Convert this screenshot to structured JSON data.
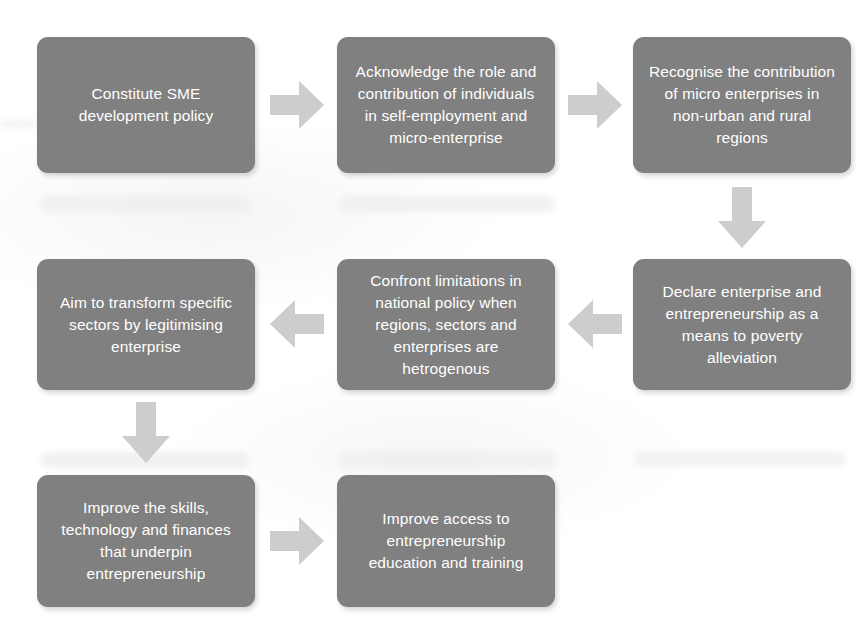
{
  "diagram": {
    "colors": {
      "node_fill": "#808080",
      "node_text": "#ffffff",
      "arrow_fill": "#cdcdcd",
      "background": "#ffffff"
    },
    "nodes": [
      {
        "id": "n1",
        "text": "Constitute SME\ndevelopment policy",
        "row": 1,
        "col": 1
      },
      {
        "id": "n2",
        "text": "Acknowledge the role and\ncontribution of individuals\nin self-employment and\nmicro-enterprise",
        "row": 1,
        "col": 2
      },
      {
        "id": "n3",
        "text": "Recognise the contribution\nof micro enterprises in\nnon-urban and rural\nregions",
        "row": 1,
        "col": 3
      },
      {
        "id": "n4",
        "text": "Declare enterprise and\nentrepreneurship as a\nmeans to poverty\nalleviation",
        "row": 2,
        "col": 3
      },
      {
        "id": "n5",
        "text": "Confront limitations in\nnational policy when\nregions, sectors and\nenterprises are\nhetrogenous",
        "row": 2,
        "col": 2
      },
      {
        "id": "n6",
        "text": "Aim to transform specific\nsectors by legitimising\nenterprise",
        "row": 2,
        "col": 1
      },
      {
        "id": "n7",
        "text": "Improve the skills,\ntechnology and finances\nthat underpin\nentrepreneurship",
        "row": 3,
        "col": 1
      },
      {
        "id": "n8",
        "text": "Improve access to\nentrepreneurship\neducation and training",
        "row": 3,
        "col": 2
      }
    ],
    "connectors": [
      {
        "id": "a1",
        "from": "n1",
        "to": "n2",
        "direction": "right"
      },
      {
        "id": "a2",
        "from": "n2",
        "to": "n3",
        "direction": "right"
      },
      {
        "id": "a3",
        "from": "n3",
        "to": "n4",
        "direction": "down"
      },
      {
        "id": "a4",
        "from": "n4",
        "to": "n5",
        "direction": "left"
      },
      {
        "id": "a5",
        "from": "n5",
        "to": "n6",
        "direction": "left"
      },
      {
        "id": "a6",
        "from": "n6",
        "to": "n7",
        "direction": "down"
      },
      {
        "id": "a7",
        "from": "n7",
        "to": "n8",
        "direction": "right"
      }
    ]
  }
}
